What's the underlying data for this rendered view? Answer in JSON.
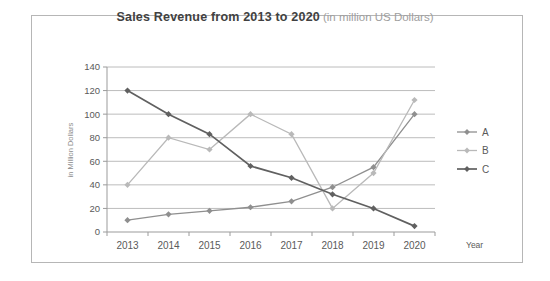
{
  "chart_data": {
    "type": "line",
    "title": "Sales Revenue from 2013 to 2020",
    "title_suffix": "(in million US Dollars)",
    "xlabel": "Year",
    "ylabel": "in Million Dollars",
    "categories": [
      "2013",
      "2014",
      "2015",
      "2016",
      "2017",
      "2018",
      "2019",
      "2020"
    ],
    "ylim": [
      0,
      140
    ],
    "yticks": [
      0,
      20,
      40,
      60,
      80,
      100,
      120,
      140
    ],
    "grid": true,
    "legend_position": "right-outside",
    "marker": "diamond",
    "series": [
      {
        "name": "A",
        "color": "#8f8f8f",
        "values": [
          10,
          15,
          18,
          21,
          26,
          38,
          55,
          100
        ]
      },
      {
        "name": "B",
        "color": "#b9b9b9",
        "values": [
          40,
          80,
          70,
          100,
          83,
          20,
          50,
          112
        ]
      },
      {
        "name": "C",
        "color": "#606060",
        "values": [
          120,
          100,
          83,
          56,
          46,
          32,
          20,
          5
        ]
      }
    ],
    "colors": {
      "card_border": "#b6b6b6",
      "background": "#ffffff",
      "axis": "#9b9b9b",
      "grid": "#ababab",
      "tick_label": "#5a5a5a",
      "title": "#414141",
      "subtitle": "#9e9e9e",
      "axis_title": "#8c8c8c"
    }
  }
}
